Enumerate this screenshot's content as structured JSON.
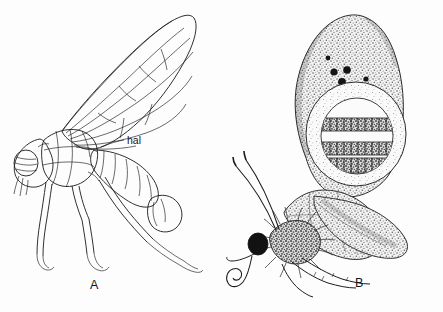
{
  "figure": {
    "background_color": "#fdfdfd",
    "ink_color": "#1a1a1a",
    "panels": [
      {
        "letter": "A",
        "subject": "fly-lateral-view-line-drawing",
        "labels": [
          {
            "text": "hal",
            "meaning": "halter"
          }
        ]
      },
      {
        "letter": "B",
        "subject": "butterfly-lateral-view-stippled-drawing",
        "signature": "C.W."
      }
    ]
  },
  "panel_a": {
    "letter": "A",
    "hal_label": "hal"
  },
  "panel_b": {
    "letter": "B",
    "signature": "C.W."
  }
}
